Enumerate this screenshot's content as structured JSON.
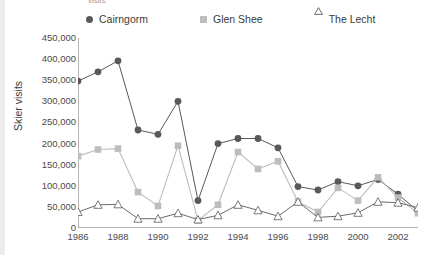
{
  "clipped_title": "visits",
  "axis": {
    "ylabel": "Skier visits",
    "xlabel": "",
    "yticks": [
      "0",
      "50,000",
      "100,000",
      "150,000",
      "200,000",
      "250,000",
      "300,000",
      "350,000",
      "400,000",
      "450,000"
    ],
    "xticks": [
      "1986",
      "1988",
      "1990",
      "1992",
      "1994",
      "1996",
      "1998",
      "2000",
      "2002"
    ]
  },
  "legend": {
    "cairngorm": "Cairngorm",
    "glen_shee": "Glen Shee",
    "the_lecht": "The Lecht"
  },
  "colors": {
    "cairngorm": "#595959",
    "glen_shee": "#bdbdbd",
    "the_lecht": "#6b6b6b",
    "axis": "#6f6f6f",
    "text": "#3b3b3b",
    "background": "#ffffff",
    "left_strip": "#ececec"
  },
  "chart_data": {
    "type": "line",
    "title": "",
    "xlabel": "",
    "ylabel": "Skier visits",
    "xlim": [
      1986,
      2003
    ],
    "ylim": [
      0,
      450000
    ],
    "ytick_step": 50000,
    "grid": false,
    "legend_position": "top",
    "x": [
      1986,
      1987,
      1988,
      1989,
      1990,
      1991,
      1992,
      1993,
      1994,
      1995,
      1996,
      1997,
      1998,
      1999,
      2000,
      2001,
      2002,
      2003
    ],
    "series": [
      {
        "name": "Cairngorm",
        "marker": "circle",
        "color": "#595959",
        "values": [
          348000,
          370000,
          396000,
          232000,
          222000,
          300000,
          65000,
          200000,
          212000,
          212000,
          190000,
          98000,
          90000,
          110000,
          100000,
          115000,
          80000,
          40000
        ]
      },
      {
        "name": "Glen Shee",
        "marker": "square",
        "color": "#bdbdbd",
        "values": [
          170000,
          186000,
          188000,
          85000,
          52000,
          195000,
          18000,
          55000,
          180000,
          140000,
          158000,
          62000,
          38000,
          95000,
          65000,
          120000,
          72000,
          35000
        ]
      },
      {
        "name": "The Lecht",
        "marker": "triangle",
        "color": "#6b6b6b",
        "values": [
          38000,
          55000,
          56000,
          22000,
          22000,
          35000,
          20000,
          30000,
          55000,
          42000,
          28000,
          62000,
          25000,
          28000,
          36000,
          62000,
          60000,
          48000
        ]
      }
    ]
  }
}
